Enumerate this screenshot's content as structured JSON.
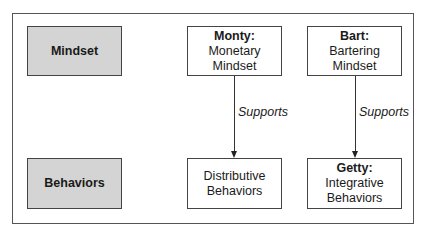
{
  "rows": [
    {
      "label": "Mindset"
    },
    {
      "label": "Behaviors"
    }
  ],
  "nodes": {
    "monty": {
      "title": "Monty:",
      "lines": [
        "Monetary",
        "Mindset"
      ]
    },
    "bart": {
      "title": "Bart:",
      "lines": [
        "Bartering",
        "Mindset"
      ]
    },
    "distributive": {
      "title": "",
      "lines": [
        "Distributive",
        "Behaviors"
      ]
    },
    "getty": {
      "title": "Getty:",
      "lines": [
        "Integrative",
        "Behaviors"
      ]
    }
  },
  "edges": [
    {
      "from": "monty",
      "to": "distributive",
      "label": "Supports"
    },
    {
      "from": "bart",
      "to": "getty",
      "label": "Supports"
    }
  ],
  "colors": {
    "row_label_fill": "#d4d4d4",
    "node_fill": "#ffffff",
    "border": "#444444"
  }
}
